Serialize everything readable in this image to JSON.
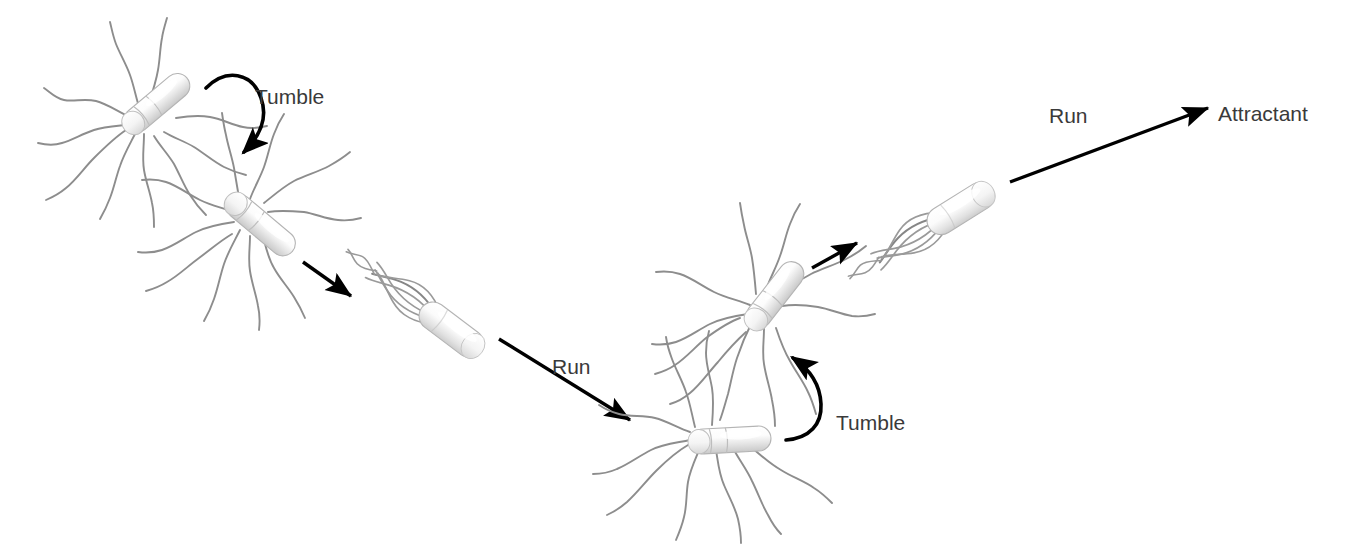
{
  "diagram": {
    "background_color": "#ffffff",
    "width": 1360,
    "height": 551,
    "colors": {
      "flagellum": "#8d8d8d",
      "arrow": "#000000",
      "label_text": "#3a3a3a",
      "cell_body_light": "#fdfdfd",
      "cell_body_shadow": "#d3d3d3",
      "cell_outline": "#b4b4b4"
    },
    "labels": [
      {
        "id": "tumble-1",
        "text": "Tumble",
        "x": 255,
        "y": 104
      },
      {
        "id": "run-1",
        "text": "Run",
        "x": 552,
        "y": 374
      },
      {
        "id": "tumble-2",
        "text": "Tumble",
        "x": 836,
        "y": 430
      },
      {
        "id": "run-2",
        "text": "Run",
        "x": 1049,
        "y": 123
      },
      {
        "id": "attractant",
        "text": "Attractant",
        "x": 1218,
        "y": 121
      }
    ],
    "arrows": [
      {
        "id": "tumble-arrow-1",
        "label": "Tumble",
        "kind": "curved",
        "direction": "clockwise-down"
      },
      {
        "id": "run-arrow-short-1",
        "label": "Run",
        "kind": "straight",
        "direction": "down-right"
      },
      {
        "id": "run-arrow-long-1",
        "label": "Run",
        "kind": "straight",
        "direction": "down-right"
      },
      {
        "id": "tumble-arrow-2",
        "label": "Tumble",
        "kind": "curved",
        "direction": "counterclockwise-up"
      },
      {
        "id": "run-arrow-short-2",
        "label": "Run",
        "kind": "straight",
        "direction": "up-right"
      },
      {
        "id": "run-arrow-long-2",
        "label": "Run",
        "kind": "straight",
        "direction": "up-right"
      }
    ],
    "cells": [
      {
        "id": "tumbling-cell-1",
        "state": "tumbling",
        "description": "flagella splayed apart"
      },
      {
        "id": "tumbling-cell-2",
        "state": "tumbling",
        "description": "flagella splayed apart"
      },
      {
        "id": "running-cell-1",
        "state": "running",
        "description": "flagella bundled into a single helical tail"
      },
      {
        "id": "tumbling-cell-3",
        "state": "tumbling",
        "description": "flagella splayed apart"
      },
      {
        "id": "tumbling-cell-4",
        "state": "tumbling",
        "description": "flagella splayed apart"
      },
      {
        "id": "running-cell-2",
        "state": "running",
        "description": "flagella bundled into a single helical tail"
      }
    ]
  }
}
